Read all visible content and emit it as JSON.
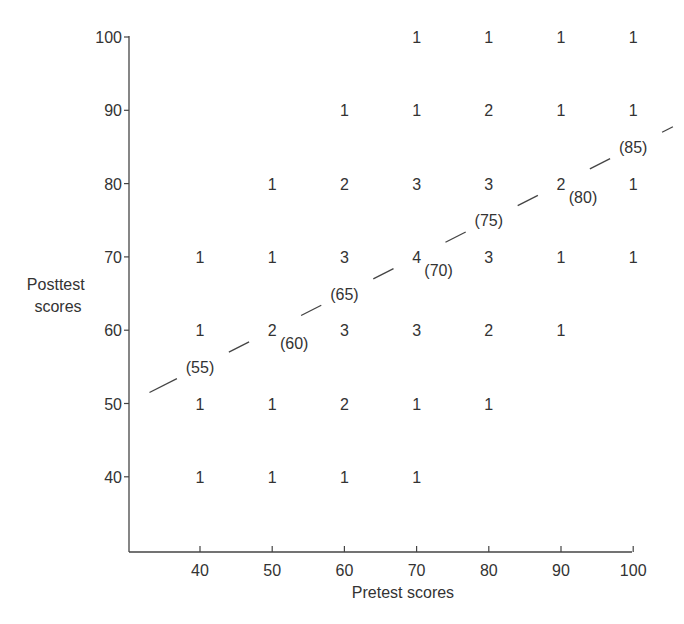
{
  "chart_data": {
    "type": "scatter",
    "subtype": "frequency-scatterplot-with-regression-line",
    "title": "",
    "xlabel": "Pretest scores",
    "ylabel": "Posttest scores",
    "ylabel_lines": [
      "Posttest",
      "scores"
    ],
    "xlim": [
      30,
      100
    ],
    "ylim": [
      30,
      100
    ],
    "x_ticks": [
      40,
      50,
      60,
      70,
      80,
      90,
      100
    ],
    "y_ticks": [
      40,
      50,
      60,
      70,
      80,
      90,
      100
    ],
    "grid": false,
    "legend": null,
    "cells": [
      {
        "x": 70,
        "y": 100,
        "count": 1
      },
      {
        "x": 80,
        "y": 100,
        "count": 1
      },
      {
        "x": 90,
        "y": 100,
        "count": 1
      },
      {
        "x": 100,
        "y": 100,
        "count": 1
      },
      {
        "x": 60,
        "y": 90,
        "count": 1
      },
      {
        "x": 70,
        "y": 90,
        "count": 1
      },
      {
        "x": 80,
        "y": 90,
        "count": 2
      },
      {
        "x": 90,
        "y": 90,
        "count": 1
      },
      {
        "x": 100,
        "y": 90,
        "count": 1
      },
      {
        "x": 50,
        "y": 80,
        "count": 1
      },
      {
        "x": 60,
        "y": 80,
        "count": 2
      },
      {
        "x": 70,
        "y": 80,
        "count": 3
      },
      {
        "x": 80,
        "y": 80,
        "count": 3
      },
      {
        "x": 90,
        "y": 80,
        "count": 2
      },
      {
        "x": 100,
        "y": 80,
        "count": 1
      },
      {
        "x": 40,
        "y": 70,
        "count": 1
      },
      {
        "x": 50,
        "y": 70,
        "count": 1
      },
      {
        "x": 60,
        "y": 70,
        "count": 3
      },
      {
        "x": 70,
        "y": 70,
        "count": 4
      },
      {
        "x": 80,
        "y": 70,
        "count": 3
      },
      {
        "x": 90,
        "y": 70,
        "count": 1
      },
      {
        "x": 100,
        "y": 70,
        "count": 1
      },
      {
        "x": 40,
        "y": 60,
        "count": 1
      },
      {
        "x": 50,
        "y": 60,
        "count": 2
      },
      {
        "x": 60,
        "y": 60,
        "count": 3
      },
      {
        "x": 70,
        "y": 60,
        "count": 3
      },
      {
        "x": 80,
        "y": 60,
        "count": 2
      },
      {
        "x": 90,
        "y": 60,
        "count": 1
      },
      {
        "x": 40,
        "y": 50,
        "count": 1
      },
      {
        "x": 50,
        "y": 50,
        "count": 1
      },
      {
        "x": 60,
        "y": 50,
        "count": 2
      },
      {
        "x": 70,
        "y": 50,
        "count": 1
      },
      {
        "x": 80,
        "y": 50,
        "count": 1
      },
      {
        "x": 40,
        "y": 40,
        "count": 1
      },
      {
        "x": 50,
        "y": 40,
        "count": 1
      },
      {
        "x": 60,
        "y": 40,
        "count": 1
      },
      {
        "x": 70,
        "y": 40,
        "count": 1
      }
    ],
    "regression_line": {
      "slope": 0.5,
      "intercept": 35,
      "x_range": [
        33,
        105
      ],
      "style": "dashed",
      "predicted_labels": [
        {
          "x": 40,
          "y": 55,
          "label": "(55)"
        },
        {
          "x": 50,
          "y": 60,
          "label": "(60)"
        },
        {
          "x": 60,
          "y": 65,
          "label": "(65)"
        },
        {
          "x": 70,
          "y": 70,
          "label": "(70)"
        },
        {
          "x": 80,
          "y": 75,
          "label": "(75)"
        },
        {
          "x": 90,
          "y": 80,
          "label": "(80)"
        },
        {
          "x": 100,
          "y": 85,
          "label": "(85)"
        }
      ]
    },
    "colors": {
      "ink": "#333333",
      "background": "#ffffff"
    }
  }
}
